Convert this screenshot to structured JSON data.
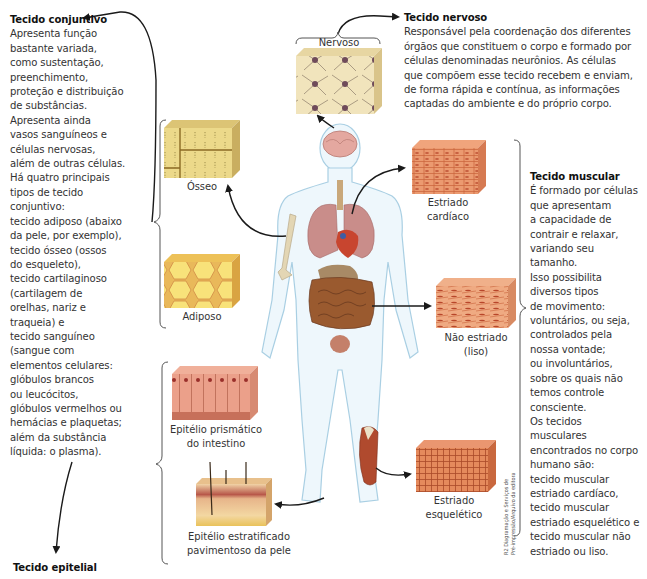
{
  "connective": {
    "title": "Tecido conjuntivo",
    "lines": [
      "Apresenta função",
      "bastante variada,",
      "como sustentação,",
      "preenchimento,",
      "proteção e distribuição",
      "de substâncias.",
      "Apresenta ainda",
      "vasos sanguíneos e",
      "células nervosas,",
      "além de outras células.",
      "Há quatro principais",
      "tipos de tecido",
      "conjuntivo:",
      "tecido adiposo (abaixo",
      "da pele, por exemplo),",
      "tecido ósseo (ossos",
      "do esqueleto),",
      "tecido cartilaginoso",
      "(cartilagem de",
      "orelhas, nariz e",
      "traqueia) e",
      "tecido sanguíneo",
      "(sangue com",
      "elementos celulares:",
      "glóbulos brancos",
      "ou leucócitos,",
      "glóbulos vermelhos ou",
      "hemácias e plaquetas;",
      "além da substância",
      "líquida: o plasma)."
    ]
  },
  "nervous": {
    "title": "Tecido nervoso",
    "lines": [
      "Responsável pela coordenação dos diferentes",
      "órgãos que constituem o corpo e formado por",
      "células denominadas neurônios. As células",
      "que compõem esse tecido recebem e enviam,",
      "de forma rápida e contínua, as informações",
      "captadas do ambiente e do próprio corpo."
    ]
  },
  "muscular": {
    "title": "Tecido muscular",
    "lines": [
      "É formado por células",
      "que apresentam",
      "a capacidade de",
      "contrair e relaxar,",
      "variando seu",
      "tamanho.",
      "Isso possibilita",
      "diversos tipos",
      "de movimento:",
      "voluntários, ou seja,",
      "controlados pela",
      "nossa vontade;",
      "ou involuntários,",
      "sobre os quais não",
      "temos controle",
      "consciente.",
      "Os tecidos",
      "musculares",
      "encontrados no corpo",
      "humano são:",
      "tecido muscular",
      "estriado cardíaco,",
      "tecido muscular",
      "estriado esquelético e",
      "tecido muscular não",
      "estriado ou liso."
    ]
  },
  "epithelial": {
    "title": "Tecido epitelial"
  },
  "captions": {
    "nervoso": "Nervoso",
    "osseo": "Ósseo",
    "adiposo": "Adiposo",
    "cardiaco": [
      "Estriado",
      "cardíaco"
    ],
    "liso": [
      "Não estriado",
      "(liso)"
    ],
    "esqueletico": [
      "Estriado",
      "esquelético"
    ],
    "prismatico": [
      "Epitélio prismático",
      "do intestino"
    ],
    "pele": [
      "Epitélio estratificado",
      "pavimentoso da pele"
    ]
  },
  "credit": [
    "R2 Diagramação e Serviços de",
    "Pré-impressão/Arquivo da editora"
  ],
  "colors": {
    "arrow": "#1a1a1a",
    "body_outline": "#a9cfe3",
    "body_fill": "#eaf5fb",
    "muscle_tissue": "#e58a5c",
    "fat_tissue": "#f4cf55",
    "bone_tissue": "#e8d27a",
    "nerve_tissue": "#efe1b5"
  }
}
